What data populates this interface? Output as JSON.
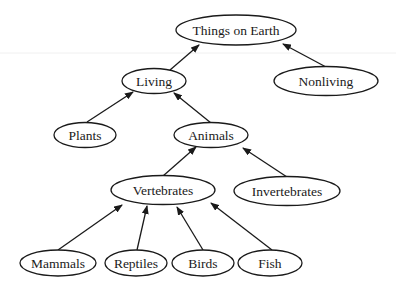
{
  "diagram": {
    "type": "tree",
    "title": "Things on Earth",
    "nodes": [
      {
        "id": "things",
        "label": "Things on Earth",
        "cx": 236,
        "cy": 30,
        "rx": 60,
        "ry": 15
      },
      {
        "id": "living",
        "label": "Living",
        "cx": 154,
        "cy": 81,
        "rx": 32,
        "ry": 12.5
      },
      {
        "id": "nonliving",
        "label": "Nonliving",
        "cx": 326,
        "cy": 81,
        "rx": 52,
        "ry": 14.5
      },
      {
        "id": "plants",
        "label": "Plants",
        "cx": 85,
        "cy": 135,
        "rx": 31,
        "ry": 12.5
      },
      {
        "id": "animals",
        "label": "Animals",
        "cx": 211,
        "cy": 135,
        "rx": 37,
        "ry": 12.5
      },
      {
        "id": "vertebrates",
        "label": "Vertebrates",
        "cx": 163,
        "cy": 190,
        "rx": 52,
        "ry": 14.5
      },
      {
        "id": "invertebrates",
        "label": "Invertebrates",
        "cx": 287,
        "cy": 191,
        "rx": 53,
        "ry": 14.5
      },
      {
        "id": "mammals",
        "label": "Mammals",
        "cx": 58,
        "cy": 263,
        "rx": 38,
        "ry": 13
      },
      {
        "id": "reptiles",
        "label": "Reptiles",
        "cx": 136,
        "cy": 263,
        "rx": 31,
        "ry": 13
      },
      {
        "id": "birds",
        "label": "Birds",
        "cx": 203,
        "cy": 263,
        "rx": 31,
        "ry": 13
      },
      {
        "id": "fish",
        "label": "Fish",
        "cx": 270,
        "cy": 263,
        "rx": 32,
        "ry": 13
      }
    ],
    "edges": [
      {
        "from": "living",
        "to": "things",
        "x1": 170,
        "y1": 70,
        "x2": 199,
        "y2": 45
      },
      {
        "from": "nonliving",
        "to": "things",
        "x1": 326,
        "y1": 67,
        "x2": 283,
        "y2": 44
      },
      {
        "from": "plants",
        "to": "living",
        "x1": 87,
        "y1": 122,
        "x2": 133,
        "y2": 92
      },
      {
        "from": "animals",
        "to": "living",
        "x1": 211,
        "y1": 123,
        "x2": 174,
        "y2": 93
      },
      {
        "from": "vertebrates",
        "to": "animals",
        "x1": 163,
        "y1": 176,
        "x2": 196,
        "y2": 147
      },
      {
        "from": "invertebrates",
        "to": "animals",
        "x1": 287,
        "y1": 177,
        "x2": 243,
        "y2": 148
      },
      {
        "from": "mammals",
        "to": "vertebrates",
        "x1": 58,
        "y1": 250,
        "x2": 122,
        "y2": 205
      },
      {
        "from": "reptiles",
        "to": "vertebrates",
        "x1": 137,
        "y1": 250,
        "x2": 147,
        "y2": 206
      },
      {
        "from": "birds",
        "to": "vertebrates",
        "x1": 203,
        "y1": 250,
        "x2": 177,
        "y2": 207
      },
      {
        "from": "fish",
        "to": "vertebrates",
        "x1": 272,
        "y1": 250,
        "x2": 211,
        "y2": 203
      }
    ],
    "colors": {
      "stroke": "#1a1a1a",
      "background": "#ffffff"
    }
  }
}
